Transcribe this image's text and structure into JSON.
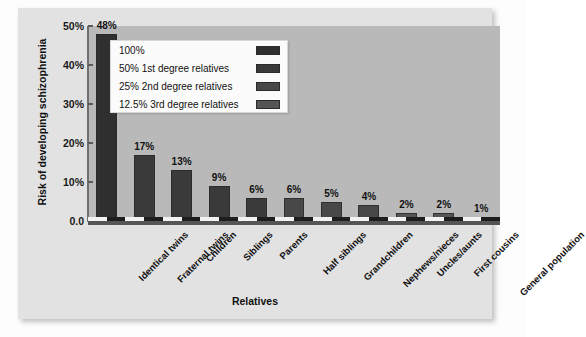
{
  "chart_data": {
    "type": "bar",
    "title": "Risk of developing schizophrenia",
    "xlabel": "Relatives",
    "ylabel": "Risk of developing schizophrenia",
    "ylim": [
      0,
      50
    ],
    "grid": false,
    "ytick_labels": [
      "50%",
      "40%",
      "30%",
      "20%",
      "10%",
      "0.0"
    ],
    "ytick_values": [
      50,
      40,
      30,
      20,
      10,
      0
    ],
    "categories": [
      "Identical twins",
      "Fraternal twins",
      "Children",
      "Siblings",
      "Parents",
      "Half siblings",
      "Grandchildren",
      "Nephews/nieces",
      "Uncles/aunts",
      "First cousins",
      "General population"
    ],
    "values": [
      48,
      17,
      13,
      9,
      6,
      6,
      5,
      4,
      2,
      2,
      1
    ],
    "value_labels": [
      "48%",
      "17%",
      "13%",
      "9%",
      "6%",
      "6%",
      "5%",
      "4%",
      "2%",
      "2%",
      "1%"
    ],
    "bar_colors": [
      "#2f2f2f",
      "#3a3a3a",
      "#3a3a3a",
      "#3a3a3a",
      "#3a3a3a",
      "#484848",
      "#484848",
      "#484848",
      "#555555",
      "#555555",
      "#fdfdfd"
    ],
    "legend": {
      "position": "upper-left-inside",
      "entries": [
        {
          "label": "100%",
          "color": "#2f2f2f"
        },
        {
          "label": "50% 1st degree relatives",
          "color": "#3a3a3a"
        },
        {
          "label": "25% 2nd degree relatives",
          "color": "#484848"
        },
        {
          "label": "12.5% 3rd degree relatives",
          "color": "#555555"
        }
      ]
    }
  },
  "colors": {
    "page_background": "#fdfdfd",
    "panel_background": "#e2e2e2",
    "plot_background": "#b9b9b9",
    "axis": "#555555",
    "text": "#111111"
  }
}
